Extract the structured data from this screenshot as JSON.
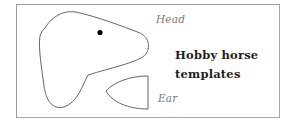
{
  "figure": {
    "title_line1": "Hobby horse",
    "title_line2": "templates",
    "labels": {
      "head": "Head",
      "ear": "Ear"
    },
    "colors": {
      "outline": "#555555",
      "frame": "#9a9a9a",
      "eye": "#000000",
      "title": "#1e1e1e",
      "label": "#7a7a7a"
    }
  }
}
